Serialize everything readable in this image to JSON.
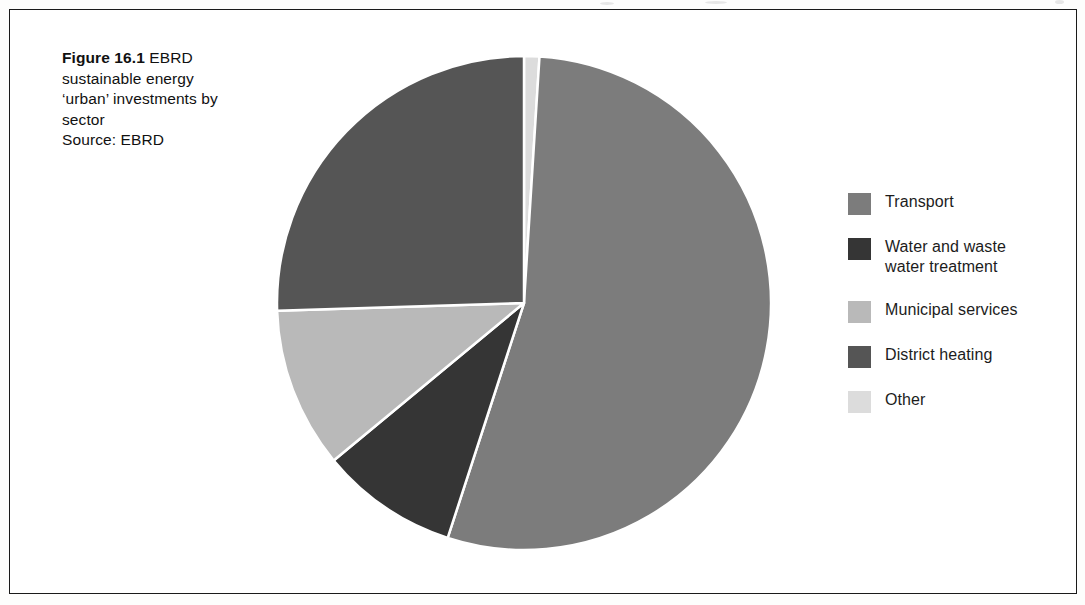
{
  "figure": {
    "label": "Figure 16.1",
    "caption_text": "EBRD sustainable energy 'urban' investments by sector",
    "caption_lines": [
      "EBRD",
      "sustainable energy",
      "‘urban’ investments by",
      "sector"
    ],
    "source": "Source: EBRD"
  },
  "legend": {
    "items": [
      {
        "label": "Transport",
        "color": "#7c7c7c"
      },
      {
        "label": "Water and waste\nwater treatment",
        "color": "#353535"
      },
      {
        "label": "Municipal services",
        "color": "#b9b9b9"
      },
      {
        "label": "District heating",
        "color": "#555555"
      },
      {
        "label": "Other",
        "color": "#dcdcdc"
      }
    ]
  },
  "chart_data": {
    "type": "pie",
    "subtitle": "",
    "xlabel": "",
    "ylabel": "",
    "legend_position": "right",
    "grid": false,
    "start_angle_deg": 0,
    "direction": "clockwise",
    "center": {
      "x": 524,
      "y": 303
    },
    "radius": 247,
    "separator_color": "#ffffff",
    "separator_width": 2.5,
    "categories": [
      "Other",
      "Transport",
      "Water and waste water treatment",
      "Municipal services",
      "District heating"
    ],
    "values": [
      1,
      54,
      9,
      10.5,
      25.5
    ],
    "units": "percent",
    "slices": [
      {
        "name": "Other",
        "percent": 1.0,
        "angle_deg": 3.6,
        "color": "#dcdcdc"
      },
      {
        "name": "Transport",
        "percent": 54.0,
        "angle_deg": 194.4,
        "color": "#7c7c7c"
      },
      {
        "name": "Water and waste water treatment",
        "percent": 9.0,
        "angle_deg": 32.4,
        "color": "#353535"
      },
      {
        "name": "Municipal services",
        "percent": 10.5,
        "angle_deg": 37.8,
        "color": "#b9b9b9"
      },
      {
        "name": "District heating",
        "percent": 25.5,
        "angle_deg": 91.8,
        "color": "#555555"
      }
    ]
  },
  "colors": {
    "frame": "#1a1a1a",
    "page_background": "#ffffff",
    "text": "#111111"
  }
}
